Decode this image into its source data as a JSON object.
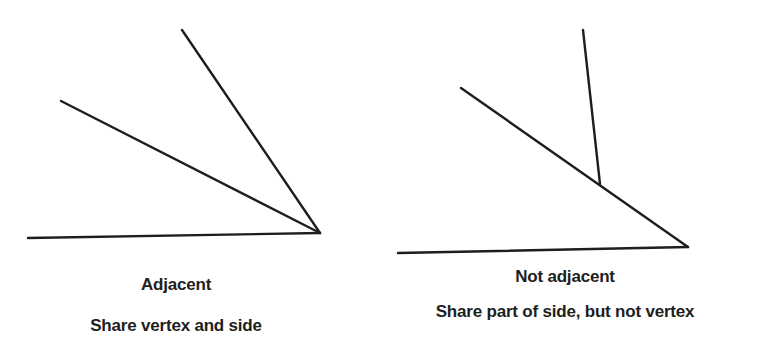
{
  "colors": {
    "background": "#ffffff",
    "line": "#1e1e1e",
    "text": "#1e1e1e"
  },
  "diagrams": [
    {
      "id": "adjacent",
      "title": "Adjacent",
      "description": "Share vertex and side",
      "lines": [
        {
          "name": "base-ray",
          "x1": 28,
          "y1": 238,
          "x2": 320,
          "y2": 233
        },
        {
          "name": "middle-ray",
          "x1": 61,
          "y1": 101,
          "x2": 320,
          "y2": 233
        },
        {
          "name": "upper-ray",
          "x1": 182,
          "y1": 30,
          "x2": 320,
          "y2": 233
        }
      ]
    },
    {
      "id": "not-adjacent",
      "title": "Not adjacent",
      "description": "Share part of side, but not vertex",
      "lines": [
        {
          "name": "base-ray",
          "x1": 398,
          "y1": 253,
          "x2": 688,
          "y2": 247
        },
        {
          "name": "long-ray",
          "x1": 461,
          "y1": 88,
          "x2": 688,
          "y2": 247
        },
        {
          "name": "short-ray",
          "x1": 583,
          "y1": 30,
          "x2": 600,
          "y2": 184
        }
      ]
    }
  ]
}
